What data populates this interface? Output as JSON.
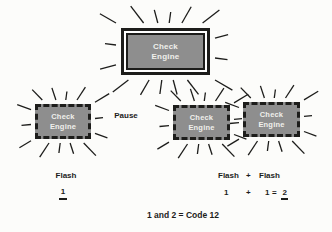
{
  "colors": {
    "background": "#fcfcfa",
    "lamp_fill": "#8e8e8e",
    "lamp_text": "#f0f0ec",
    "ink": "#1d1d1b"
  },
  "lamps": {
    "main": {
      "label": "Check\nEngine"
    },
    "flash_left": {
      "label": "Check\nEngine"
    },
    "flash_mid": {
      "label": "Check\nEngine"
    },
    "flash_right": {
      "label": "Check\nEngine"
    }
  },
  "labels": {
    "pause": "Pause",
    "flash_left_word": "Flash",
    "flash_left_count": "1",
    "flash_row": {
      "word1": "Flash",
      "plus": "+",
      "word2": "Flash"
    },
    "equation": {
      "n1": "1",
      "plus": "+",
      "n2": "1",
      "equals": "=",
      "result": "2"
    },
    "code_summary": "1 and 2 = Code 12"
  }
}
